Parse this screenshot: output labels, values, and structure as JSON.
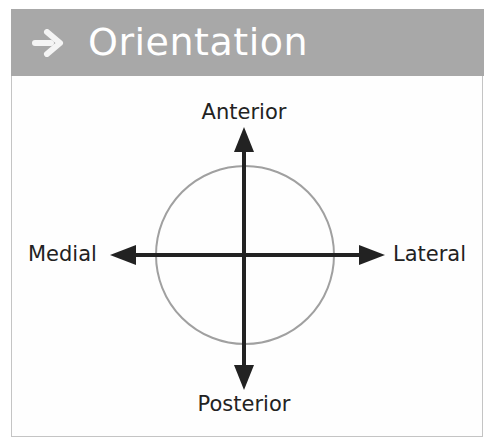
{
  "header": {
    "icon": "arrow-right-icon",
    "title": "Orientation",
    "background_color": "#a8a8a8",
    "text_color": "#ffffff"
  },
  "diagram": {
    "labels": {
      "top": "Anterior",
      "bottom": "Posterior",
      "left": "Medial",
      "right": "Lateral"
    },
    "circle_color": "#9a9a9a",
    "arrow_color": "#222222"
  }
}
